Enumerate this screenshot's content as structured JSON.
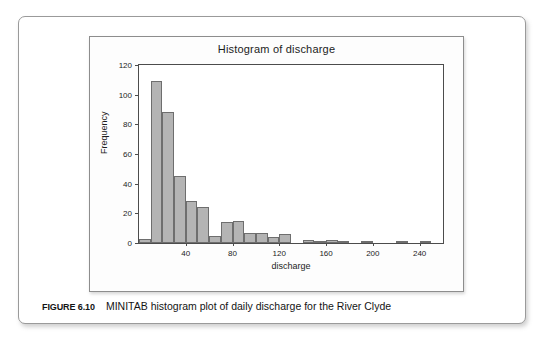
{
  "figure": {
    "caption_label": "FIGURE 6.10",
    "caption_text": "MINITAB histogram plot of daily discharge for the River Clyde"
  },
  "chart_data": {
    "type": "bar",
    "title": "Histogram of discharge",
    "xlabel": "discharge",
    "ylabel": "Frequency",
    "xlim": [
      0,
      260
    ],
    "ylim": [
      0,
      120
    ],
    "grid": false,
    "legend": null,
    "bin_width": 10,
    "xticks": [
      40,
      80,
      120,
      160,
      200,
      240
    ],
    "yticks": [
      0,
      20,
      40,
      60,
      80,
      100,
      120
    ],
    "bin_starts": [
      0,
      10,
      20,
      30,
      40,
      50,
      60,
      70,
      80,
      90,
      100,
      110,
      120,
      130,
      140,
      150,
      160,
      170,
      180,
      190,
      200,
      210,
      220,
      230,
      240,
      250
    ],
    "categories": [
      "0-10",
      "10-20",
      "20-30",
      "30-40",
      "40-50",
      "50-60",
      "60-70",
      "70-80",
      "80-90",
      "90-100",
      "100-110",
      "110-120",
      "120-130",
      "130-140",
      "140-150",
      "150-160",
      "160-170",
      "170-180",
      "180-190",
      "190-200",
      "200-210",
      "210-220",
      "220-230",
      "230-240",
      "240-250",
      "250-260"
    ],
    "values": [
      3,
      109,
      88,
      45,
      28,
      24,
      5,
      14,
      15,
      7,
      7,
      4,
      6,
      0,
      2,
      1,
      2,
      1,
      0,
      1,
      0,
      0,
      1,
      0,
      1,
      0
    ]
  }
}
